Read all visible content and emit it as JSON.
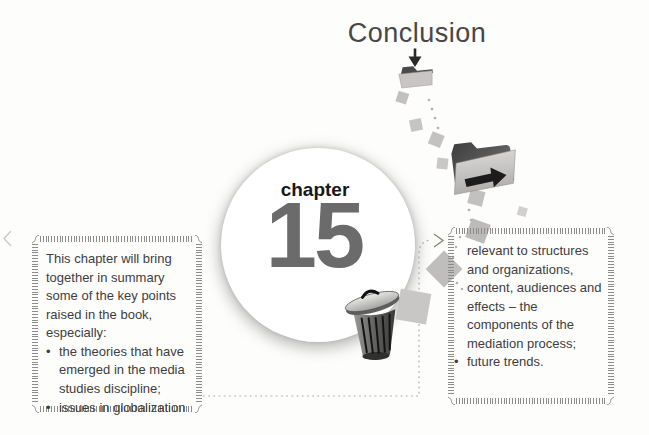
{
  "page": {
    "title": "Conclusion"
  },
  "chapter_badge": {
    "label": "chapter",
    "number": "15"
  },
  "left_box": {
    "intro": "This chapter will bring together in summary some of the key points raised in the book, especially:",
    "bullet_char": "•",
    "bullets": [
      "the theories that have emerged in the media studies discipline;",
      "issues in globalization"
    ]
  },
  "right_box": {
    "continuation": "relevant to structures and organizations, content, audiences and effects – the components of the mediation process;",
    "bullet_char": "•",
    "bullets": [
      "future trends."
    ]
  },
  "icons": {
    "down_arrow": "down-arrow-icon",
    "closed_folder": "closed-folder-icon",
    "open_folder": "open-folder-right-arrow-icon",
    "trash_can": "trash-can-icon"
  },
  "colors": {
    "text": "#3e3e3e",
    "chapter_number": "#6b6b6b",
    "tick_border": "#8c8c8c",
    "dotted_path": "#b6aba0",
    "square_gray": "#c5c4c2"
  }
}
